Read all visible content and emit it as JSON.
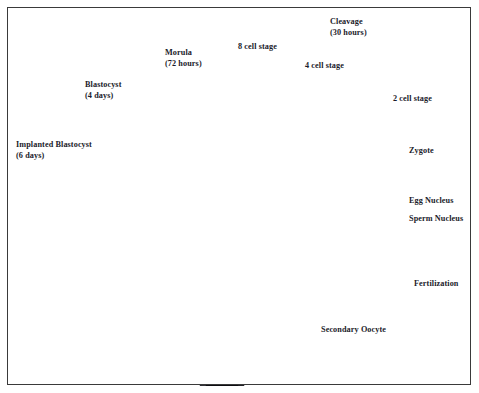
{
  "figure": {
    "border_color": "#3a3a3a",
    "background_color": "#ffffff",
    "text_color": "#1b1b2a"
  },
  "labels": [
    {
      "id": "implanted-blastocyst",
      "line1": "Implanted Blastocyst",
      "line2": "(6 days)",
      "x": 16,
      "y": 140
    },
    {
      "id": "blastocyst",
      "line1": "Blastocyst",
      "line2": "(4 days)",
      "x": 85,
      "y": 80
    },
    {
      "id": "morula",
      "line1": "Morula",
      "line2": "(72 hours)",
      "x": 165,
      "y": 48
    },
    {
      "id": "eight-cell-stage",
      "line1": "8 cell stage",
      "line2": "",
      "x": 238,
      "y": 42
    },
    {
      "id": "cleavage",
      "line1": "Cleavage",
      "line2": "(30 hours)",
      "x": 330,
      "y": 17
    },
    {
      "id": "four-cell-stage",
      "line1": "4 cell stage",
      "line2": "",
      "x": 305,
      "y": 61
    },
    {
      "id": "two-cell-stage",
      "line1": "2 cell stage",
      "line2": "",
      "x": 393,
      "y": 94
    },
    {
      "id": "zygote",
      "line1": "Zygote",
      "line2": "",
      "x": 409,
      "y": 146
    },
    {
      "id": "egg-nucleus",
      "line1": "Egg Nucleus",
      "line2": "",
      "x": 409,
      "y": 196
    },
    {
      "id": "sperm-nucleus",
      "line1": "Sperm Nucleus",
      "line2": "",
      "x": 409,
      "y": 214
    },
    {
      "id": "fertilization",
      "line1": "Fertilization",
      "line2": "",
      "x": 414,
      "y": 279
    },
    {
      "id": "secondary-oocyte",
      "line1": "Secondary Oocyte",
      "line2": "",
      "x": 321,
      "y": 325
    }
  ],
  "stages": [
    {
      "id": "implanted-blastocyst-cell",
      "name": "Implanted Blastocyst",
      "time": "6 days",
      "cx": 104,
      "cy": 160,
      "r": 15,
      "kind": "grainy-solid"
    },
    {
      "id": "blastocyst-cell",
      "name": "Blastocyst",
      "time": "4 days",
      "cx": 140,
      "cy": 111,
      "r": 17,
      "kind": "blastocyst"
    },
    {
      "id": "morula-cell",
      "name": "Morula",
      "time": "72 hours",
      "cx": 199,
      "cy": 91,
      "r": 17,
      "kind": "morula"
    },
    {
      "id": "eight-cell",
      "name": "8 cell stage",
      "time": "",
      "cx": 257,
      "cy": 82,
      "r": 17,
      "kind": "cells-8"
    },
    {
      "id": "four-cell",
      "name": "4 cell stage",
      "time": "",
      "cx": 304,
      "cy": 94,
      "r": 17,
      "kind": "cells-4"
    },
    {
      "id": "two-cell",
      "name": "2 cell stage",
      "time": "",
      "cx": 345,
      "cy": 117,
      "r": 17,
      "kind": "cells-2"
    },
    {
      "id": "zygote-cell",
      "name": "Zygote",
      "time": "",
      "cx": 377,
      "cy": 153,
      "r": 17,
      "kind": "zygote"
    },
    {
      "id": "pronuclei-cell",
      "name": "Egg Nucleus / Sperm Nucleus",
      "time": "",
      "cx": 385,
      "cy": 204,
      "r": 17,
      "kind": "pronuclei"
    },
    {
      "id": "fertilization-cell",
      "name": "Fertilization",
      "time": "",
      "cx": 381,
      "cy": 255,
      "r": 17,
      "kind": "fertilization"
    },
    {
      "id": "secondary-oocyte-cell",
      "name": "Secondary Oocyte",
      "time": "",
      "cx": 338,
      "cy": 298,
      "r": 17,
      "kind": "oocyte"
    }
  ],
  "anatomy": [
    {
      "id": "uterus",
      "name": "Uterus"
    },
    {
      "id": "uterine-cavity",
      "name": "Uterine cavity / endometrium"
    },
    {
      "id": "cervix",
      "name": "Cervix"
    },
    {
      "id": "vagina",
      "name": "Vagina"
    },
    {
      "id": "left-fallopian-tube",
      "name": "Left fallopian tube"
    },
    {
      "id": "right-fallopian-tube",
      "name": "Right fallopian tube"
    },
    {
      "id": "left-ovary",
      "name": "Left ovary"
    },
    {
      "id": "right-ovary",
      "name": "Right ovary with follicles"
    },
    {
      "id": "fimbriae",
      "name": "Fimbriae"
    }
  ],
  "brace": {
    "id": "cleavage-brace",
    "label": "Cleavage (30 hours)",
    "start_x": 248,
    "apex_x": 347,
    "end_x": 460
  }
}
